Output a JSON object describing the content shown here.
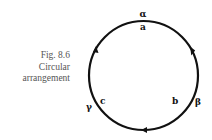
{
  "figure": {
    "number": "Fig. 8.6",
    "title_line1": "Circular",
    "title_line2": "arrangement"
  },
  "diagram": {
    "type": "circular-cycle",
    "direction": "clockwise",
    "nodes": [
      {
        "inner": "a",
        "outer": "α",
        "position": "top"
      },
      {
        "inner": "b",
        "outer": "β",
        "position": "lower-right"
      },
      {
        "inner": "c",
        "outer": "γ",
        "position": "lower-left"
      }
    ],
    "stroke_color": "#111111"
  }
}
